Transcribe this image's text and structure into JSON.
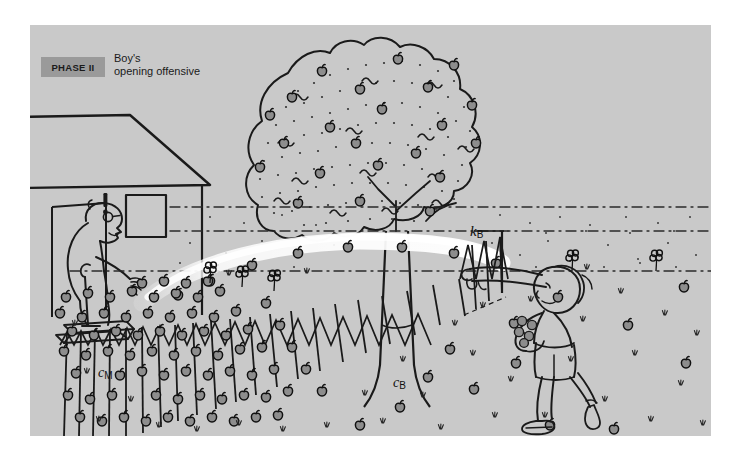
{
  "figure": {
    "title_badge": "PHASE II",
    "caption_line_1": "Boy's",
    "caption_line_2": "opening offensive",
    "background_color": "#c9c9c9",
    "badge_color": "#9a9a9a",
    "ink_color": "#1a1a1a",
    "page_color": "#ffffff",
    "scene_description": "Cartoon diagram of a yard split by a picket fence: an angry old man with a cane stands in a doorway on the left where fallen apples are densely piled, a large apple tree stands in the middle, and a boy on the right throws apples over the fence toward the man's side."
  },
  "annotations": [
    {
      "name": "concentration-man-side",
      "symbol": "c",
      "subscript": "M",
      "meaning": "apple concentration on the man's side of the fence"
    },
    {
      "name": "concentration-boy-side",
      "symbol": "c",
      "subscript": "B",
      "meaning": "apple concentration on the boy's side of the fence"
    },
    {
      "name": "rate-constant-boy",
      "symbol": "k",
      "subscript": "B",
      "meaning": "rate constant for the boy throwing apples over the fence"
    }
  ],
  "elements": {
    "exclamation_mark": "!",
    "house": "house-with-doorway",
    "man": "old-man-with-cane",
    "tree": "apple-tree",
    "fence": "picket-fence",
    "boy": "boy-throwing-apples",
    "trajectory": "apple-throw-arc",
    "flowers": "ground-flowers",
    "apples_dense_side": "man-side",
    "apples_sparse_side": "boy-side"
  }
}
